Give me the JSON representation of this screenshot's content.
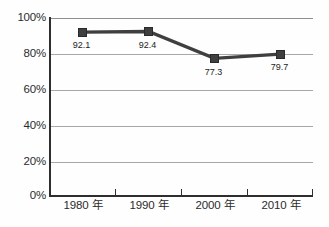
{
  "chart_data": {
    "type": "line",
    "title": "",
    "subtitle": "",
    "xlabel": "",
    "ylabel": "",
    "categories": [
      "1980 年",
      "1990 年",
      "2000 年",
      "2010 年"
    ],
    "values": [
      92.1,
      92.4,
      77.3,
      79.7
    ],
    "data_labels": [
      "92.1",
      "92.4",
      "77.3",
      "79.7"
    ],
    "series": [
      {
        "name": "",
        "values": [
          92.1,
          92.4,
          77.3,
          79.7
        ],
        "marker": "square",
        "color": "#3f3f3f"
      }
    ],
    "ylim": [
      0,
      100
    ],
    "ytick_values": [
      0,
      20,
      40,
      60,
      80,
      100
    ],
    "ytick_labels": [
      "0%",
      "20%",
      "40%",
      "60%",
      "80%",
      "100%"
    ],
    "grid": true,
    "grid_axis": "y",
    "legend": false,
    "legend_position": "none",
    "colors": {
      "line": "#3f3f3f",
      "marker": "#3f3f3f",
      "grid": "#a8a8a8",
      "axis": "#2e2e2e",
      "text": "#2b2b2b",
      "background": "#fefefe"
    }
  },
  "axes": {
    "y": {
      "ticks": [
        {
          "label": "100%",
          "value": 100
        },
        {
          "label": "80%",
          "value": 80
        },
        {
          "label": "60%",
          "value": 60
        },
        {
          "label": "40%",
          "value": 40
        },
        {
          "label": "20%",
          "value": 20
        },
        {
          "label": "0%",
          "value": 0
        }
      ]
    },
    "x": {
      "ticks": [
        {
          "label": "1980 年"
        },
        {
          "label": "1990 年"
        },
        {
          "label": "2000 年"
        },
        {
          "label": "2010 年"
        }
      ]
    }
  },
  "points": [
    {
      "label": "92.1",
      "category": "1980 年",
      "value": 92.1
    },
    {
      "label": "92.4",
      "category": "1990 年",
      "value": 92.4
    },
    {
      "label": "77.3",
      "category": "2000 年",
      "value": 77.3
    },
    {
      "label": "79.7",
      "category": "2010 年",
      "value": 79.7
    }
  ]
}
